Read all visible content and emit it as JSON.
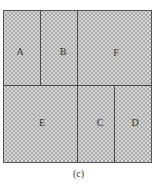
{
  "figure": {
    "caption": "(c)",
    "regions": [
      {
        "label": "A"
      },
      {
        "label": "B"
      },
      {
        "label": "F"
      },
      {
        "label": "E"
      },
      {
        "label": "C"
      },
      {
        "label": "D"
      }
    ]
  }
}
